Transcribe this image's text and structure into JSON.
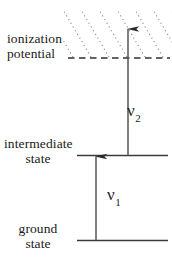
{
  "diagram": {
    "type": "energy-level-diagram",
    "colors": {
      "line": "#333333",
      "text": "#1a1a1a",
      "hatch": "#8a8a8a",
      "background": "#ffffff"
    },
    "levels": [
      {
        "id": "ionization-potential",
        "label_line1": "ionization",
        "label_line2": "potential",
        "style": "dashed",
        "y": 58,
        "x_start": 68,
        "x_end": 170
      },
      {
        "id": "intermediate-state",
        "label_line1": "intermediate",
        "label_line2": "state",
        "style": "solid",
        "y": 155,
        "x_start": 77,
        "x_end": 168
      },
      {
        "id": "ground-state",
        "label_line1": "ground",
        "label_line2": "state",
        "style": "solid",
        "y": 240,
        "x_start": 77,
        "x_end": 168
      }
    ],
    "transitions": [
      {
        "id": "nu1",
        "symbol": "ν",
        "subscript": "1",
        "from_level": "ground-state",
        "to_level": "intermediate-state",
        "x": 96,
        "y_start": 240,
        "y_end": 155,
        "direction": "up"
      },
      {
        "id": "nu2",
        "symbol": "ν",
        "subscript": "2",
        "from_level": "intermediate-state",
        "to_level": "continuum",
        "x": 128,
        "y_start": 155,
        "y_end": 28,
        "direction": "up"
      }
    ],
    "continuum": {
      "id": "continuum-region",
      "description": "hatched continuum above ionization potential",
      "hatch_style": "dotted-diagonal",
      "y_top": 12,
      "y_bottom": 58,
      "x_start": 62,
      "x_end": 172
    }
  }
}
